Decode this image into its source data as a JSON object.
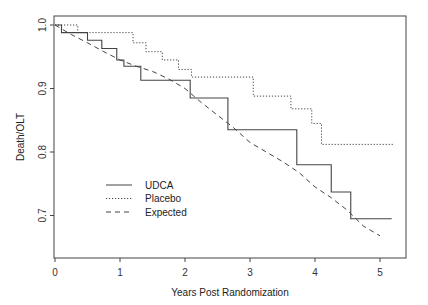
{
  "chart_data": {
    "type": "line",
    "title": "",
    "xlabel": "Years Post Randomization",
    "ylabel": "Death/OLT",
    "xlim": [
      0,
      5.3
    ],
    "ylim": [
      0.65,
      1.01
    ],
    "x_ticks": [
      0,
      1,
      2,
      3,
      4,
      5
    ],
    "x_tick_labels": [
      "0",
      "1",
      "2",
      "3",
      "4",
      "5"
    ],
    "y_ticks": [
      0.7,
      0.8,
      0.9,
      1.0
    ],
    "y_tick_labels": [
      "0.7",
      "0.8",
      "0.9",
      "1.0"
    ],
    "grid": false,
    "legend_position": "lower left (inside)",
    "series": [
      {
        "name": "UDCA",
        "style": "solid",
        "step": true,
        "x": [
          0,
          0.1,
          0.5,
          0.72,
          0.95,
          1.06,
          1.32,
          2.08,
          2.66,
          3.72,
          4.25,
          4.55,
          5.18
        ],
        "y": [
          1.0,
          0.988,
          0.976,
          0.963,
          0.945,
          0.935,
          0.913,
          0.885,
          0.835,
          0.78,
          0.737,
          0.695,
          0.695
        ]
      },
      {
        "name": "Placebo",
        "style": "dotted",
        "step": true,
        "x": [
          0,
          0.35,
          1.2,
          1.4,
          1.65,
          1.9,
          2.1,
          3.05,
          3.63,
          3.95,
          4.1,
          5.2
        ],
        "y": [
          1.0,
          0.988,
          0.972,
          0.958,
          0.945,
          0.93,
          0.918,
          0.888,
          0.868,
          0.845,
          0.812,
          0.812
        ]
      },
      {
        "name": "Expected",
        "style": "dashed",
        "step": false,
        "x": [
          0,
          0.25,
          0.5,
          0.75,
          1.0,
          1.25,
          1.5,
          1.75,
          2.0,
          2.25,
          2.5,
          2.75,
          3.0,
          3.25,
          3.5,
          3.75,
          4.0,
          4.25,
          4.5,
          4.75,
          5.0
        ],
        "y": [
          1.0,
          0.985,
          0.972,
          0.958,
          0.945,
          0.935,
          0.927,
          0.915,
          0.9,
          0.878,
          0.858,
          0.838,
          0.815,
          0.8,
          0.785,
          0.768,
          0.745,
          0.728,
          0.708,
          0.683,
          0.668
        ]
      }
    ]
  },
  "legend": {
    "items": [
      {
        "label": "UDCA",
        "style": "solid"
      },
      {
        "label": "Placebo",
        "style": "dotted"
      },
      {
        "label": "Expected",
        "style": "dashed"
      }
    ]
  },
  "colors": {
    "line": "#444444",
    "axis": "#333333",
    "background": "#ffffff"
  }
}
